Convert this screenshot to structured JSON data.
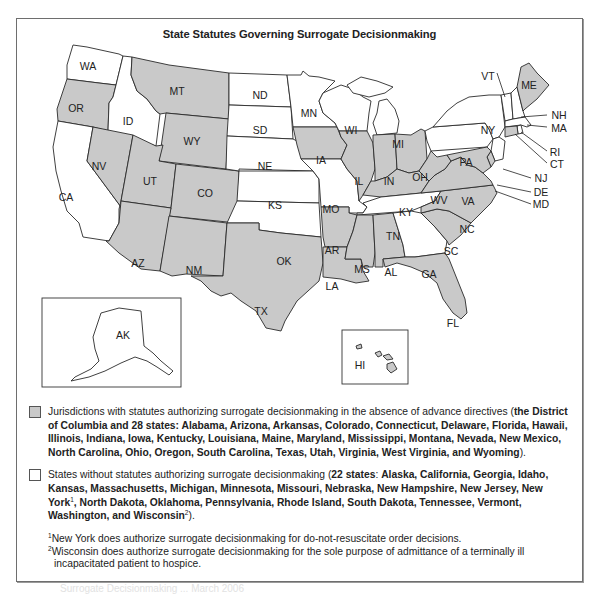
{
  "figure": {
    "title": "State Statutes Governing Surrogate Decisionmaking"
  },
  "colors": {
    "with_statute": "#c9c9c9",
    "without_statute": "#ffffff",
    "border": "#2a2a2a"
  },
  "map": {
    "states": [
      {
        "abbr": "WA",
        "category": "without"
      },
      {
        "abbr": "OR",
        "category": "with"
      },
      {
        "abbr": "CA",
        "category": "without"
      },
      {
        "abbr": "ID",
        "category": "without"
      },
      {
        "abbr": "NV",
        "category": "with"
      },
      {
        "abbr": "MT",
        "category": "with"
      },
      {
        "abbr": "WY",
        "category": "with"
      },
      {
        "abbr": "UT",
        "category": "with"
      },
      {
        "abbr": "CO",
        "category": "with"
      },
      {
        "abbr": "AZ",
        "category": "with"
      },
      {
        "abbr": "NM",
        "category": "with"
      },
      {
        "abbr": "ND",
        "category": "without"
      },
      {
        "abbr": "SD",
        "category": "without"
      },
      {
        "abbr": "NE",
        "category": "without"
      },
      {
        "abbr": "KS",
        "category": "without"
      },
      {
        "abbr": "OK",
        "category": "without"
      },
      {
        "abbr": "TX",
        "category": "with"
      },
      {
        "abbr": "MN",
        "category": "without"
      },
      {
        "abbr": "IA",
        "category": "with"
      },
      {
        "abbr": "MO",
        "category": "without"
      },
      {
        "abbr": "AR",
        "category": "with"
      },
      {
        "abbr": "LA",
        "category": "with"
      },
      {
        "abbr": "WI",
        "category": "without"
      },
      {
        "abbr": "IL",
        "category": "with"
      },
      {
        "abbr": "MI",
        "category": "without"
      },
      {
        "abbr": "IN",
        "category": "with"
      },
      {
        "abbr": "OH",
        "category": "with"
      },
      {
        "abbr": "KY",
        "category": "with"
      },
      {
        "abbr": "TN",
        "category": "without"
      },
      {
        "abbr": "MS",
        "category": "with"
      },
      {
        "abbr": "AL",
        "category": "with"
      },
      {
        "abbr": "GA",
        "category": "without"
      },
      {
        "abbr": "FL",
        "category": "with"
      },
      {
        "abbr": "SC",
        "category": "with"
      },
      {
        "abbr": "NC",
        "category": "with"
      },
      {
        "abbr": "VA",
        "category": "with"
      },
      {
        "abbr": "WV",
        "category": "with"
      },
      {
        "abbr": "PA",
        "category": "without"
      },
      {
        "abbr": "NY",
        "category": "without"
      },
      {
        "abbr": "VT",
        "category": "without"
      },
      {
        "abbr": "NH",
        "category": "without"
      },
      {
        "abbr": "ME",
        "category": "with"
      },
      {
        "abbr": "MA",
        "category": "without"
      },
      {
        "abbr": "RI",
        "category": "without"
      },
      {
        "abbr": "CT",
        "category": "with"
      },
      {
        "abbr": "NJ",
        "category": "without"
      },
      {
        "abbr": "DE",
        "category": "with"
      },
      {
        "abbr": "MD",
        "category": "with"
      },
      {
        "abbr": "AK",
        "category": "without"
      },
      {
        "abbr": "HI",
        "category": "with"
      }
    ],
    "labels": {
      "WA": "WA",
      "OR": "OR",
      "CA": "CA",
      "ID": "ID",
      "NV": "NV",
      "MT": "MT",
      "WY": "WY",
      "UT": "UT",
      "CO": "CO",
      "AZ": "AZ",
      "NM": "NM",
      "ND": "ND",
      "SD": "SD",
      "NE": "NE",
      "KS": "KS",
      "OK": "OK",
      "TX": "TX",
      "MN": "MN",
      "IA": "IA",
      "MO": "MO",
      "AR": "AR",
      "LA": "LA",
      "WI": "WI",
      "IL": "IL",
      "MI": "MI",
      "IN": "IN",
      "OH": "OH",
      "KY": "KY",
      "TN": "TN",
      "MS": "MS",
      "AL": "AL",
      "GA": "GA",
      "FL": "FL",
      "SC": "SC",
      "NC": "NC",
      "VA": "VA",
      "WV": "WV",
      "PA": "PA",
      "NY": "NY",
      "VT": "VT",
      "NH": "NH",
      "ME": "ME",
      "MA": "MA",
      "RI": "RI",
      "CT": "CT",
      "NJ": "NJ",
      "DE": "DE",
      "MD": "MD",
      "AK": "AK",
      "HI": "HI"
    }
  },
  "legend": {
    "with_statute": {
      "lead": "Jurisdictions with statutes authorizing surrogate decisionmaking in the absence of advance directives",
      "open": " (",
      "detail": "the District of Columbia and 28 states: Alabama, Arizona, Arkansas, Colorado, Connecticut, Delaware, Florida, Hawaii, Illinois, Indiana, Iowa, Kentucky, Louisiana, Maine, Maryland, Mississippi, Montana, Nevada, New Mexico, North Carolina, Ohio, Oregon, South Carolina, Texas, Utah, Virginia, West Virginia, and Wyoming",
      "close": ")."
    },
    "without_statute": {
      "lead": "States without statutes authorizing surrogate decisionmaking",
      "open": " (",
      "count": "22 states",
      "colon": ": ",
      "detail_a": "Alaska, California, Georgia, Idaho, Kansas, Massachusetts, Michigan, Minnesota, Missouri, Nebraska, New Hampshire, New Jersey, New York",
      "sup1": "1",
      "detail_b": ", North Dakota, Oklahoma, Pennsylvania, Rhode Island, South Dakota, Tennessee, Vermont, Washington, and Wisconsin",
      "sup2": "2",
      "close": ")."
    },
    "footnotes": [
      {
        "mark": "1",
        "text": "New York does authorize surrogate decisionmaking for do-not-resuscitate order decisions."
      },
      {
        "mark": "2",
        "text": "Wisconsin does authorize surrogate decisionmaking for the sole purpose of admittance of a terminally ill incapacitated patient to hospice."
      }
    ]
  },
  "caption_faded": "Surrogate Decisionmaking ... March 2006"
}
